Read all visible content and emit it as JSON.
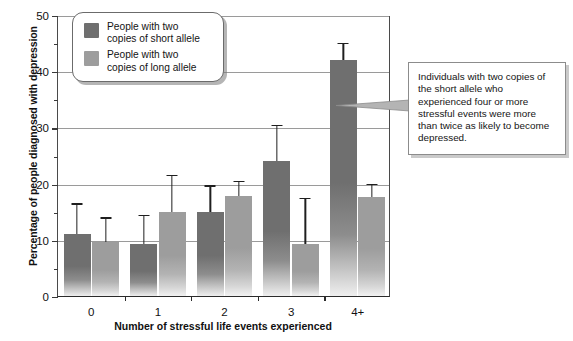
{
  "chart_data": {
    "type": "bar",
    "title": "",
    "xlabel": "Number of stressful life events experienced",
    "ylabel": "Percentage of people diagnosed with depression",
    "categories": [
      "0",
      "1",
      "2",
      "3",
      "4+"
    ],
    "ylim": [
      0,
      50
    ],
    "ytick_labels": [
      "0",
      "10",
      "20",
      "30",
      "40",
      "50"
    ],
    "ytick_values": [
      0,
      10,
      20,
      30,
      40,
      50
    ],
    "yminor_values": [
      5,
      15,
      25,
      35,
      45
    ],
    "grid": "horizontal-major",
    "legend_position": "upper-left-inside",
    "series": [
      {
        "name": "People with two copies of short allele",
        "color": "#6f6f6f",
        "values": [
          11.0,
          9.3,
          15.0,
          24.0,
          42.0
        ],
        "error_high": [
          16.5,
          14.5,
          19.7,
          30.5,
          45.0
        ]
      },
      {
        "name": "People with two copies of long allele",
        "color": "#9d9d9d",
        "values": [
          9.7,
          15.0,
          17.8,
          9.3,
          17.7
        ],
        "error_high": [
          14.0,
          21.5,
          20.5,
          17.5,
          20.0
        ]
      }
    ]
  },
  "legend": {
    "items": [
      {
        "label_line1": "People with two",
        "label_line2": "copies of short allele",
        "swatch": "short"
      },
      {
        "label_line1": "People with two",
        "label_line2": "copies of long allele",
        "swatch": "long"
      }
    ]
  },
  "callout": {
    "text": "Individuals with two copies of the short allele who experienced four or more stressful events were more than twice as likely to become depressed.",
    "points_to": "4+ short allele bar"
  }
}
